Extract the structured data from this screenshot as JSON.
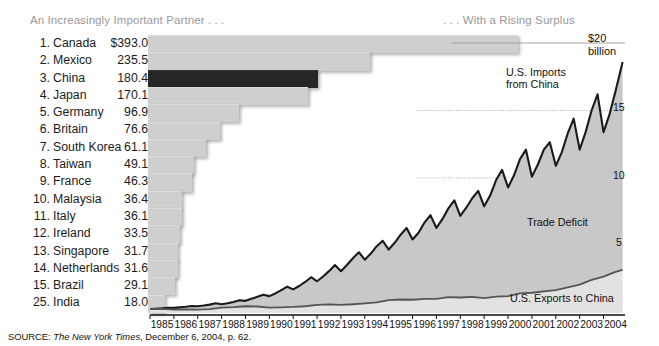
{
  "panels": {
    "left_title": "An Increasingly Important Partner . . .",
    "right_title": ". . . With a Rising Surplus"
  },
  "source": {
    "prefix": "SOURCE: ",
    "publication": "The New York Times",
    "suffix": ", December 6, 2004, p. 62."
  },
  "colors": {
    "bar": "#cfcfcf",
    "bar_highlight": "#262626",
    "area_fill": "#c8c8c8",
    "line_dark": "#1a1a1a",
    "title_gray": "#9a9a9a"
  },
  "chart_data": [
    {
      "type": "bar",
      "title": "An Increasingly Important Partner . . .",
      "orientation": "horizontal",
      "xlabel": "",
      "ylabel": "",
      "unit": "$ billions",
      "value_prefix_first": "$",
      "highlight_category": "China",
      "xlim": [
        0,
        393
      ],
      "grid": false,
      "categories": [
        "Canada",
        "Mexico",
        "China",
        "Japan",
        "Germany",
        "Britain",
        "South Korea",
        "Taiwan",
        "France",
        "Malaysia",
        "Italy",
        "Ireland",
        "Singapore",
        "Netherlands",
        "Brazil",
        "India"
      ],
      "ranks": [
        1,
        2,
        3,
        4,
        5,
        6,
        7,
        8,
        9,
        10,
        11,
        12,
        13,
        14,
        15,
        25
      ],
      "values": [
        393.0,
        235.5,
        180.4,
        170.1,
        96.9,
        76.6,
        61.1,
        49.1,
        46.3,
        36.4,
        36.1,
        33.5,
        31.7,
        31.6,
        29.1,
        18.0
      ],
      "value_labels": [
        "$393.0",
        "235.5",
        "180.4",
        "170.1",
        "96.9",
        "76.6",
        "61.1",
        "49.1",
        "46.3",
        "36.4",
        "36.1",
        "33.5",
        "31.7",
        "31.6",
        "29.1",
        "18.0"
      ]
    },
    {
      "type": "area",
      "title": ". . . With a Rising Surplus",
      "xlabel": "",
      "ylabel": "$20 billion",
      "ylim": [
        0,
        20
      ],
      "yticks": [
        5,
        10,
        15,
        20
      ],
      "ytick_labels": [
        "5",
        "10",
        "15",
        "$20"
      ],
      "ytick_unit": "billion",
      "grid": true,
      "legend_position": "inline-annotations",
      "annotations": [
        {
          "text": "U.S. Imports from China",
          "lines": [
            "U.S. Imports",
            "from China"
          ]
        },
        {
          "text": "Trade Deficit",
          "lines": [
            "Trade Deficit"
          ]
        },
        {
          "text": "U.S. Exports to China",
          "lines": [
            "U.S. Exports to China"
          ]
        }
      ],
      "xlim": [
        1985.0,
        2004.9
      ],
      "xticks": [
        1985,
        1986,
        1987,
        1988,
        1989,
        1990,
        1991,
        1992,
        1993,
        1994,
        1995,
        1996,
        1997,
        1998,
        1999,
        2000,
        2001,
        2002,
        2003,
        2004
      ],
      "xtick_labels": [
        "1985",
        "1986",
        "1987",
        "1988",
        "1989",
        "1990",
        "1991",
        "1992",
        "1993",
        "1994",
        "1995",
        "1996",
        "1997",
        "1998",
        "1999",
        "2000",
        "2001",
        "2002",
        "2003",
        "2004"
      ],
      "series": [
        {
          "name": "U.S. Imports from China",
          "style": "dark-line",
          "x": [
            1985.0,
            1985.25,
            1985.5,
            1985.75,
            1986.0,
            1986.25,
            1986.5,
            1986.75,
            1987.0,
            1987.25,
            1987.5,
            1987.75,
            1988.0,
            1988.25,
            1988.5,
            1988.75,
            1989.0,
            1989.25,
            1989.5,
            1989.75,
            1990.0,
            1990.25,
            1990.5,
            1990.75,
            1991.0,
            1991.25,
            1991.5,
            1991.75,
            1992.0,
            1992.25,
            1992.5,
            1992.75,
            1993.0,
            1993.25,
            1993.5,
            1993.75,
            1994.0,
            1994.25,
            1994.5,
            1994.75,
            1995.0,
            1995.25,
            1995.5,
            1995.75,
            1996.0,
            1996.25,
            1996.5,
            1996.75,
            1997.0,
            1997.25,
            1997.5,
            1997.75,
            1998.0,
            1998.25,
            1998.5,
            1998.75,
            1999.0,
            1999.25,
            1999.5,
            1999.75,
            2000.0,
            2000.25,
            2000.5,
            2000.75,
            2001.0,
            2001.25,
            2001.5,
            2001.75,
            2002.0,
            2002.25,
            2002.5,
            2002.75,
            2003.0,
            2003.25,
            2003.5,
            2003.75,
            2004.0,
            2004.25,
            2004.5,
            2004.8
          ],
          "y": [
            0.3,
            0.32,
            0.34,
            0.38,
            0.38,
            0.42,
            0.46,
            0.52,
            0.5,
            0.55,
            0.62,
            0.72,
            0.65,
            0.72,
            0.82,
            0.95,
            0.9,
            1.05,
            1.2,
            1.35,
            1.25,
            1.45,
            1.7,
            1.95,
            1.75,
            2.0,
            2.3,
            2.65,
            2.35,
            2.7,
            3.1,
            3.55,
            3.1,
            3.55,
            4.05,
            4.5,
            3.95,
            4.4,
            4.95,
            5.35,
            4.7,
            5.2,
            5.8,
            6.3,
            5.45,
            5.95,
            6.7,
            7.25,
            6.3,
            6.95,
            7.75,
            8.35,
            7.2,
            7.8,
            8.5,
            9.05,
            7.9,
            8.7,
            9.85,
            10.6,
            9.3,
            10.2,
            11.4,
            12.1,
            10.1,
            11.0,
            12.1,
            12.65,
            10.9,
            11.9,
            13.3,
            14.4,
            12.1,
            13.4,
            15.0,
            16.2,
            13.4,
            14.7,
            16.4,
            18.6
          ]
        },
        {
          "name": "U.S. Exports to China",
          "style": "mid-line",
          "x": [
            1985.0,
            1985.5,
            1986.0,
            1986.5,
            1987.0,
            1987.5,
            1988.0,
            1988.5,
            1989.0,
            1989.5,
            1990.0,
            1990.5,
            1991.0,
            1991.5,
            1992.0,
            1992.5,
            1993.0,
            1993.5,
            1994.0,
            1994.5,
            1995.0,
            1995.5,
            1996.0,
            1996.5,
            1997.0,
            1997.5,
            1998.0,
            1998.5,
            1999.0,
            1999.5,
            2000.0,
            2000.5,
            2001.0,
            2001.5,
            2002.0,
            2002.5,
            2003.0,
            2003.5,
            2004.0,
            2004.5,
            2004.8
          ],
          "y": [
            0.28,
            0.3,
            0.25,
            0.26,
            0.25,
            0.28,
            0.4,
            0.44,
            0.5,
            0.48,
            0.4,
            0.42,
            0.45,
            0.5,
            0.6,
            0.64,
            0.6,
            0.65,
            0.72,
            0.78,
            0.95,
            1.0,
            0.98,
            1.05,
            1.05,
            1.18,
            1.15,
            1.2,
            1.1,
            1.22,
            1.25,
            1.45,
            1.5,
            1.6,
            1.7,
            1.9,
            2.1,
            2.45,
            2.7,
            3.05,
            3.2
          ]
        }
      ],
      "fill_between": {
        "name": "Trade Deficit",
        "upper_series": "U.S. Imports from China",
        "lower_series": "U.S. Exports to China",
        "color": "#c8c8c8"
      }
    }
  ]
}
